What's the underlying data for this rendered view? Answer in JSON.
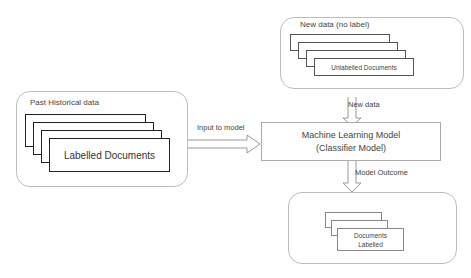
{
  "diagram": {
    "past_group": {
      "title": "Past Historical data",
      "document_label": "Labelled Documents"
    },
    "new_group": {
      "title": "New data (no label)",
      "document_label": "Unlabelled Documents"
    },
    "model": {
      "line1": "Machine Learning Model",
      "line2": "(Classifier Model)"
    },
    "output_group": {
      "document_label_line1": "Documents",
      "document_label_line2": "Labelled"
    },
    "arrows": {
      "input": "Input to model",
      "new_data": "New data",
      "outcome": "Model Outcome"
    },
    "colors": {
      "group_border": "#bdbdbd",
      "arrow": "#999999",
      "doc_border_dark": "#222222"
    }
  }
}
